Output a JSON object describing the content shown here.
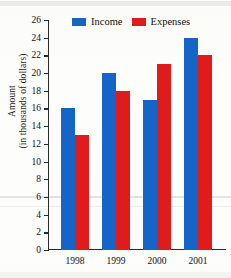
{
  "chart_data": {
    "type": "bar",
    "title": "",
    "xlabel": "",
    "ylabel_line1": "Amount",
    "ylabel_line2": "(in thousands of dollars)",
    "categories": [
      "1998",
      "1999",
      "2000",
      "2001"
    ],
    "series": [
      {
        "name": "Income",
        "color": "#1565c8",
        "values": [
          16,
          20,
          17,
          24
        ]
      },
      {
        "name": "Expenses",
        "color": "#e01b1b",
        "values": [
          13,
          18,
          21,
          22
        ]
      }
    ],
    "ylim": [
      0,
      26
    ],
    "ytick_step": 2,
    "ytick_labels": [
      "0",
      "2",
      "4",
      "6",
      "8",
      "10",
      "12",
      "14",
      "16",
      "18",
      "20",
      "22",
      "24",
      "26"
    ],
    "grid": false,
    "legend_position": "top"
  },
  "legend": {
    "income_label": "Income",
    "expenses_label": "Expenses"
  },
  "title_remnant": ""
}
